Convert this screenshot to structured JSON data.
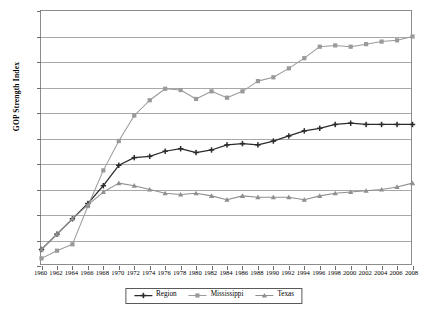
{
  "chart_data": {
    "type": "line",
    "title": "",
    "xlabel": "",
    "ylabel": "GOP Strength Index",
    "ylim": [
      0,
      0.2
    ],
    "ytick_values": [
      0,
      0.02,
      0.04,
      0.06,
      0.08,
      0.1,
      0.12,
      0.14,
      0.16,
      0.18,
      0.2
    ],
    "ytick_labels": [
      "0",
      "0.02",
      "0.04",
      "0.06",
      "0.08",
      "0.1",
      "0.12",
      "0.14",
      "0.16",
      "0.18",
      "0.2"
    ],
    "grid": true,
    "legend_position": "bottom",
    "x": [
      1960,
      1962,
      1964,
      1966,
      1968,
      1970,
      1972,
      1974,
      1976,
      1978,
      1980,
      1982,
      1984,
      1986,
      1988,
      1990,
      1992,
      1994,
      1996,
      1998,
      2000,
      2002,
      2004,
      2006,
      2008
    ],
    "xtick_labels": [
      "1960",
      "1962",
      "1964",
      "1966",
      "1968",
      "1970",
      "1972",
      "1974",
      "1976",
      "1978",
      "1980",
      "1982",
      "1984",
      "1986",
      "1988",
      "1990",
      "1992",
      "1994",
      "1996",
      "1998",
      "2000",
      "2002",
      "2004",
      "2006",
      "2008"
    ],
    "series": [
      {
        "name": "Region",
        "color": "#2b2b2b",
        "marker": "plus",
        "values": [
          0.013,
          0.025,
          0.037,
          0.049,
          0.063,
          0.079,
          0.085,
          0.086,
          0.09,
          0.092,
          0.089,
          0.091,
          0.095,
          0.096,
          0.095,
          0.098,
          0.102,
          0.106,
          0.108,
          0.111,
          0.112,
          0.111,
          0.111,
          0.111,
          0.111
        ]
      },
      {
        "name": "Mississippi",
        "color": "#9a9a9a",
        "marker": "square",
        "values": [
          0.006,
          0.012,
          0.017,
          0.047,
          0.075,
          0.098,
          0.118,
          0.13,
          0.139,
          0.138,
          0.131,
          0.137,
          0.132,
          0.137,
          0.145,
          0.148,
          0.155,
          0.163,
          0.172,
          0.173,
          0.172,
          0.174,
          0.176,
          0.177,
          0.18
        ]
      },
      {
        "name": "Texas",
        "color": "#8f8f8f",
        "marker": "triangle",
        "values": [
          0.013,
          0.025,
          0.037,
          0.048,
          0.058,
          0.065,
          0.063,
          0.06,
          0.057,
          0.056,
          0.057,
          0.055,
          0.052,
          0.055,
          0.054,
          0.054,
          0.054,
          0.052,
          0.055,
          0.057,
          0.058,
          0.059,
          0.06,
          0.062,
          0.065
        ]
      }
    ]
  },
  "legend": {
    "items": [
      {
        "label": "Region"
      },
      {
        "label": "Mississippi"
      },
      {
        "label": "Texas"
      }
    ]
  }
}
